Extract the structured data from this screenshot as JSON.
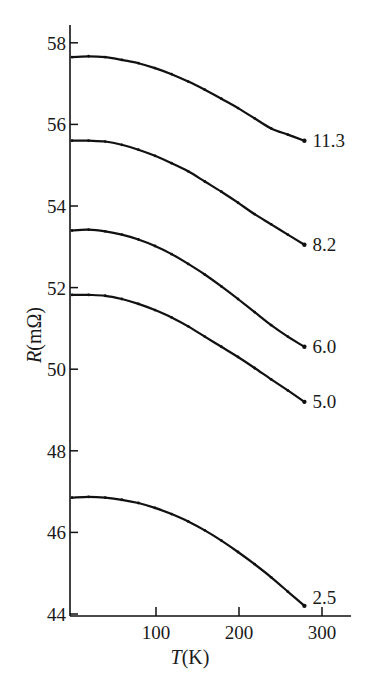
{
  "chart_data": {
    "type": "line",
    "title": "",
    "xlabel": "T(K)",
    "ylabel": "R(mΩ)",
    "xlim": [
      0,
      340
    ],
    "ylim": [
      44,
      58.5
    ],
    "x_ticks": [
      100,
      200,
      300
    ],
    "y_ticks": [
      44,
      46,
      48,
      50,
      52,
      54,
      56,
      58
    ],
    "grid": false,
    "legend": "inline labels at right end of each curve",
    "series": [
      {
        "name": "11.3",
        "x": [
          0,
          20,
          40,
          60,
          80,
          100,
          120,
          140,
          160,
          180,
          200,
          220,
          240,
          260,
          280
        ],
        "values": [
          57.65,
          57.67,
          57.65,
          57.58,
          57.5,
          57.38,
          57.23,
          57.05,
          56.85,
          56.63,
          56.4,
          56.15,
          55.9,
          55.75,
          55.6
        ]
      },
      {
        "name": "8.2",
        "x": [
          0,
          20,
          40,
          60,
          80,
          100,
          120,
          140,
          160,
          180,
          200,
          220,
          240,
          260,
          280
        ],
        "values": [
          55.6,
          55.6,
          55.58,
          55.5,
          55.38,
          55.23,
          55.05,
          54.85,
          54.6,
          54.35,
          54.08,
          53.8,
          53.55,
          53.3,
          53.05
        ]
      },
      {
        "name": "6.0",
        "x": [
          0,
          20,
          40,
          60,
          80,
          100,
          120,
          140,
          160,
          180,
          200,
          220,
          240,
          260,
          280
        ],
        "values": [
          53.4,
          53.42,
          53.38,
          53.3,
          53.18,
          53.02,
          52.82,
          52.58,
          52.32,
          52.03,
          51.72,
          51.4,
          51.08,
          50.8,
          50.55
        ]
      },
      {
        "name": "5.0",
        "x": [
          0,
          20,
          40,
          60,
          80,
          100,
          120,
          140,
          160,
          180,
          200,
          220,
          240,
          260,
          280
        ],
        "values": [
          51.82,
          51.82,
          51.8,
          51.72,
          51.6,
          51.45,
          51.27,
          51.05,
          50.8,
          50.55,
          50.3,
          50.03,
          49.75,
          49.48,
          49.2
        ]
      },
      {
        "name": "2.5",
        "x": [
          0,
          20,
          40,
          60,
          80,
          100,
          120,
          140,
          160,
          180,
          200,
          220,
          240,
          260,
          280
        ],
        "values": [
          46.85,
          46.87,
          46.85,
          46.8,
          46.72,
          46.6,
          46.45,
          46.27,
          46.05,
          45.8,
          45.52,
          45.22,
          44.9,
          44.55,
          44.2
        ]
      }
    ]
  },
  "axes": {
    "y_title": "R(mΩ)",
    "y_title_italic": "R",
    "y_title_unit": "(mΩ)",
    "x_title_italic": "T",
    "x_title_unit": "(K)",
    "y_tick_labels": [
      "44",
      "46",
      "48",
      "50",
      "52",
      "54",
      "56",
      "58"
    ],
    "x_tick_labels": [
      "100",
      "200",
      "300"
    ]
  },
  "curve_labels": [
    "11.3",
    "8.2",
    "6.0",
    "5.0",
    "2.5"
  ]
}
